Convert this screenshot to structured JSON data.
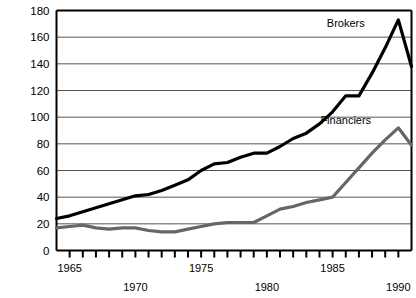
{
  "chart_data": {
    "type": "line",
    "title": "",
    "xlabel": "",
    "ylabel": "",
    "xlim": [
      1964,
      1991
    ],
    "ylim": [
      0,
      180
    ],
    "grid": true,
    "legend_position": "inline-annotation",
    "y_ticks": [
      0,
      20,
      40,
      60,
      80,
      100,
      120,
      140,
      160,
      180
    ],
    "y_tick_labels": [
      "0",
      "20",
      "40",
      "60",
      "80",
      "100",
      "120",
      "140",
      "160",
      "180"
    ],
    "x_ticks": [
      1964,
      1965,
      1966,
      1967,
      1968,
      1969,
      1970,
      1971,
      1972,
      1973,
      1974,
      1975,
      1976,
      1977,
      1978,
      1979,
      1980,
      1981,
      1982,
      1983,
      1984,
      1985,
      1986,
      1987,
      1988,
      1989,
      1990,
      1991
    ],
    "x_tick_labels_upper": [
      "1965",
      "1975",
      "1985"
    ],
    "x_tick_labels_lower": [
      "1970",
      "1980",
      "1990"
    ],
    "x_tick_label_years_upper": [
      1965,
      1975,
      1985
    ],
    "x_tick_label_years_lower": [
      1970,
      1980,
      1990
    ],
    "x": [
      1964,
      1965,
      1966,
      1967,
      1968,
      1969,
      1970,
      1971,
      1972,
      1973,
      1974,
      1975,
      1976,
      1977,
      1978,
      1979,
      1980,
      1981,
      1982,
      1983,
      1984,
      1985,
      1986,
      1987,
      1988,
      1989,
      1990,
      1991
    ],
    "series": [
      {
        "name": "Brokers",
        "color": "#000000",
        "label_x": 1986,
        "label_y": 168,
        "values": [
          24,
          26,
          29,
          32,
          35,
          38,
          41,
          42,
          45,
          49,
          53,
          60,
          65,
          66,
          70,
          73,
          73,
          78,
          84,
          88,
          95,
          104,
          116,
          116,
          133,
          152,
          173,
          138
        ]
      },
      {
        "name": "Financiers",
        "color": "#666666",
        "label_x": 1986,
        "label_y": 95,
        "values": [
          17,
          18,
          19,
          17,
          16,
          17,
          17,
          15,
          14,
          14,
          16,
          18,
          20,
          21,
          21,
          21,
          26,
          31,
          33,
          36,
          38,
          40,
          51,
          62,
          73,
          83,
          92,
          79
        ]
      }
    ]
  }
}
